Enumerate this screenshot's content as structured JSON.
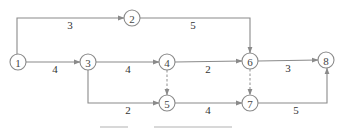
{
  "diagram": {
    "type": "activity-on-arrow network (double-code network plan)",
    "nodes": [
      {
        "id": "1",
        "label": "1",
        "x": 18,
        "y": 62
      },
      {
        "id": "2",
        "label": "2",
        "x": 132,
        "y": 18
      },
      {
        "id": "3",
        "label": "3",
        "x": 88,
        "y": 62
      },
      {
        "id": "4",
        "label": "4",
        "x": 167,
        "y": 62
      },
      {
        "id": "5",
        "label": "5",
        "x": 167,
        "y": 103
      },
      {
        "id": "6",
        "label": "6",
        "x": 250,
        "y": 61
      },
      {
        "id": "7",
        "label": "7",
        "x": 250,
        "y": 103
      },
      {
        "id": "8",
        "label": "8",
        "x": 326,
        "y": 60
      }
    ],
    "edges": [
      {
        "from": "1",
        "to": "2",
        "duration": "3",
        "dummy": false
      },
      {
        "from": "1",
        "to": "3",
        "duration": "4",
        "dummy": false
      },
      {
        "from": "2",
        "to": "6",
        "duration": "5",
        "dummy": false
      },
      {
        "from": "3",
        "to": "4",
        "duration": "4",
        "dummy": false
      },
      {
        "from": "3",
        "to": "5",
        "duration": "2",
        "dummy": false
      },
      {
        "from": "4",
        "to": "6",
        "duration": "2",
        "dummy": false
      },
      {
        "from": "4",
        "to": "5",
        "duration": "",
        "dummy": true
      },
      {
        "from": "5",
        "to": "7",
        "duration": "4",
        "dummy": false
      },
      {
        "from": "6",
        "to": "7",
        "duration": "",
        "dummy": true
      },
      {
        "from": "6",
        "to": "8",
        "duration": "3",
        "dummy": false
      },
      {
        "from": "7",
        "to": "8",
        "duration": "5",
        "dummy": false
      }
    ],
    "edge_labels": {
      "e12": "3",
      "e13": "4",
      "e26": "5",
      "e34": "4",
      "e35": "2",
      "e46": "2",
      "e57": "4",
      "e68": "3",
      "e78": "5"
    },
    "node_labels": {
      "n1": "1",
      "n2": "2",
      "n3": "3",
      "n4": "4",
      "n5": "5",
      "n6": "6",
      "n7": "7",
      "n8": "8"
    },
    "caption": {
      "visible": "clipped",
      "note": "caption text cut off at bottom edge"
    },
    "colors": {
      "line": "#8a8a8a",
      "text": "#333333",
      "background": "#ffffff"
    }
  }
}
